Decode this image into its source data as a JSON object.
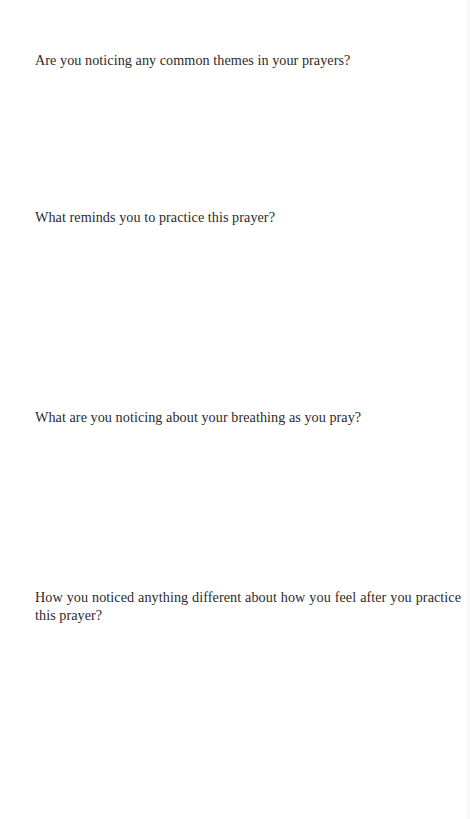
{
  "document": {
    "type": "reflection-worksheet",
    "questions": [
      {
        "text": "Are you noticing any common themes in your prayers?"
      },
      {
        "text": "What reminds you to practice this prayer?"
      },
      {
        "text": "What are you noticing about your breathing as you pray?"
      },
      {
        "text": "How you noticed anything different about how you feel after you practice this prayer?"
      }
    ]
  },
  "colors": {
    "background": "#ffffff",
    "text": "#2b2b2b"
  }
}
